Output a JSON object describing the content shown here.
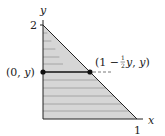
{
  "diagram": {
    "axes": {
      "x_label": "x",
      "y_label": "y",
      "x_tick": "1",
      "y_tick": "2"
    },
    "region": {
      "shape": "triangle",
      "vertices": [
        [
          0,
          0
        ],
        [
          1,
          0
        ],
        [
          0,
          2
        ]
      ],
      "fill": "#d6d6d6",
      "hatch": "horizontal lines"
    },
    "segment": {
      "left_point_label_open": "(0, ",
      "left_point_label_var": "y",
      "left_point_label_close": ")",
      "right_point_label_pre": "(1 − ",
      "right_point_label_frac_num": "1",
      "right_point_label_frac_den": "2",
      "right_point_label_var1": "y",
      "right_point_label_mid": ", ",
      "right_point_label_var2": "y",
      "right_point_label_close": ")"
    },
    "colors": {
      "fill": "#d6d6d6",
      "hatch": "#9a9a9a",
      "ink": "#222222"
    }
  }
}
